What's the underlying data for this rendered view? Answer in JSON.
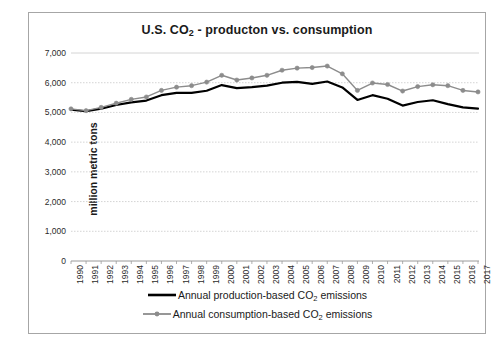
{
  "chart_data": {
    "type": "line",
    "title": "U.S. CO2 - producton vs. consumption",
    "title_parts": {
      "pre": "U.S. CO",
      "sub": "2",
      "post": " - producton vs. consumption"
    },
    "xlabel": "",
    "ylabel": "million metric tons",
    "categories": [
      "1990",
      "1991",
      "1992",
      "1993",
      "1994",
      "1995",
      "1996",
      "1997",
      "1998",
      "1999",
      "2000",
      "2001",
      "2002",
      "2003",
      "2004",
      "2005",
      "2006",
      "2007",
      "2008",
      "2009",
      "2010",
      "2011",
      "2012",
      "2013",
      "2014",
      "2015",
      "2016",
      "2017"
    ],
    "ylim": [
      0,
      7000
    ],
    "ytick_values": [
      0,
      1000,
      2000,
      3000,
      4000,
      5000,
      6000,
      7000
    ],
    "ytick_labels": [
      "0",
      "1,000",
      "2,000",
      "3,000",
      "4,000",
      "5,000",
      "6,000",
      "7,000"
    ],
    "grid": true,
    "legend_position": "bottom",
    "series": [
      {
        "name": "Annual production-based CO2 emissions",
        "name_parts": {
          "pre": "Annual production-based CO",
          "sub": "2",
          "post": " emissions"
        },
        "color": "#000000",
        "marker": "none",
        "width": 2.2,
        "values": [
          5090,
          5040,
          5130,
          5250,
          5340,
          5400,
          5580,
          5660,
          5660,
          5730,
          5920,
          5820,
          5850,
          5900,
          6000,
          6030,
          5960,
          6040,
          5840,
          5420,
          5580,
          5460,
          5230,
          5350,
          5410,
          5280,
          5170,
          5130
        ]
      },
      {
        "name": "Annual consumption-based CO2 emissions",
        "name_parts": {
          "pre": "Annual consumption-based CO",
          "sub": "2",
          "post": " emissions"
        },
        "color": "#8c8c8c",
        "marker": "circle",
        "width": 1.4,
        "values": [
          5120,
          5060,
          5170,
          5310,
          5440,
          5520,
          5740,
          5850,
          5900,
          6020,
          6250,
          6090,
          6160,
          6250,
          6420,
          6490,
          6510,
          6560,
          6300,
          5740,
          5990,
          5940,
          5720,
          5870,
          5930,
          5900,
          5740,
          5690
        ]
      }
    ]
  }
}
